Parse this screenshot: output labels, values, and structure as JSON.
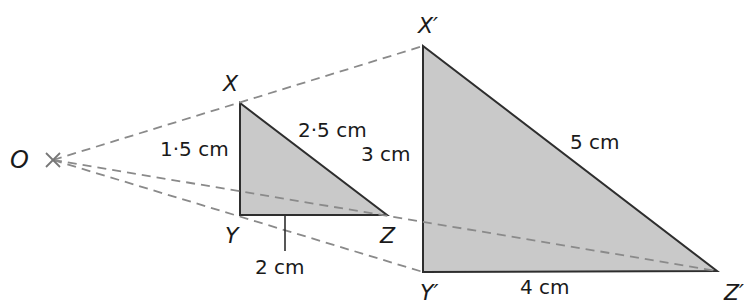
{
  "diagram": {
    "type": "enlargement",
    "colors": {
      "fill": "#c9c9c9",
      "stroke": "#2e2e2e",
      "dash": "#8a8a8a"
    },
    "centre": {
      "label": "O",
      "x": 53,
      "y": 160
    },
    "small_triangle": {
      "vertices": {
        "X": {
          "label": "X",
          "x": 240,
          "y": 103
        },
        "Y": {
          "label": "Y",
          "x": 240,
          "y": 215
        },
        "Z": {
          "label": "Z",
          "x": 387,
          "y": 215
        }
      },
      "sides": {
        "XY": "1·5 cm",
        "XZ": "2·5 cm",
        "YZ": "2 cm"
      }
    },
    "large_triangle": {
      "vertices": {
        "X": {
          "label": "X′",
          "x": 423,
          "y": 46
        },
        "Y": {
          "label": "Y′",
          "x": 423,
          "y": 272
        },
        "Z": {
          "label": "Z′",
          "x": 717,
          "y": 271
        }
      },
      "sides": {
        "XY": "3 cm",
        "XZ": "5 cm",
        "YZ": "4 cm"
      }
    }
  }
}
